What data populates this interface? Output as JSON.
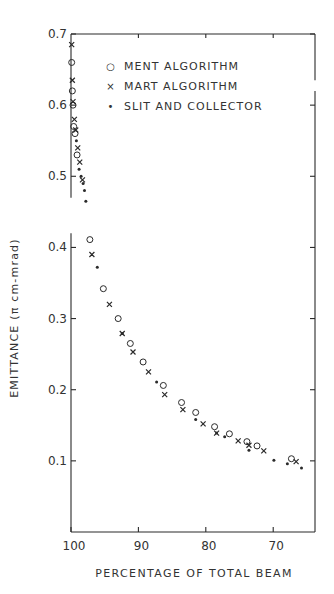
{
  "chart_data": {
    "type": "scatter",
    "title": "",
    "xlabel": "PERCENTAGE OF TOTAL BEAM",
    "ylabel": "EMITTANCE (π cm-mrad)",
    "xlim": [
      100,
      63.8
    ],
    "ylim": [
      0.0,
      0.7
    ],
    "x_inverted": true,
    "x_ticks": [
      100,
      90,
      80,
      70
    ],
    "x_tick_labels": [
      "100",
      "90",
      "80",
      "70"
    ],
    "y_ticks": [
      0.1,
      0.2,
      0.3,
      0.4,
      0.5,
      0.6,
      0.7
    ],
    "y_tick_labels": [
      "0.1",
      "0.2",
      "0.3",
      "0.4",
      "0.5",
      "0.6",
      "0.7"
    ],
    "y_axis_break": [
      0.42,
      0.47
    ],
    "grid": false,
    "legend_position": "upper center",
    "series": [
      {
        "name": "MENT ALGORITHM",
        "marker": "open-circle",
        "points": [
          [
            99.9,
            0.66
          ],
          [
            99.8,
            0.62
          ],
          [
            99.7,
            0.6
          ],
          [
            99.6,
            0.57
          ],
          [
            99.4,
            0.56
          ],
          [
            99.1,
            0.53
          ],
          [
            97.2,
            0.411
          ],
          [
            95.2,
            0.342
          ],
          [
            93.0,
            0.3
          ],
          [
            91.2,
            0.265
          ],
          [
            89.3,
            0.239
          ],
          [
            86.3,
            0.206
          ],
          [
            83.6,
            0.182
          ],
          [
            81.5,
            0.168
          ],
          [
            78.7,
            0.148
          ],
          [
            76.5,
            0.138
          ],
          [
            73.9,
            0.127
          ],
          [
            72.4,
            0.121
          ],
          [
            67.3,
            0.103
          ]
        ]
      },
      {
        "name": "MART ALGORITHM",
        "marker": "x",
        "points": [
          [
            99.9,
            0.685
          ],
          [
            99.8,
            0.635
          ],
          [
            99.7,
            0.605
          ],
          [
            99.5,
            0.58
          ],
          [
            99.3,
            0.565
          ],
          [
            99.0,
            0.54
          ],
          [
            98.7,
            0.52
          ],
          [
            98.3,
            0.495
          ],
          [
            96.9,
            0.39
          ],
          [
            94.3,
            0.32
          ],
          [
            92.4,
            0.279
          ],
          [
            90.8,
            0.253
          ],
          [
            88.5,
            0.225
          ],
          [
            86.1,
            0.193
          ],
          [
            83.4,
            0.172
          ],
          [
            80.4,
            0.152
          ],
          [
            78.4,
            0.139
          ],
          [
            75.2,
            0.128
          ],
          [
            73.6,
            0.122
          ],
          [
            71.4,
            0.114
          ],
          [
            66.6,
            0.099
          ]
        ]
      },
      {
        "name": "SLIT AND COLLECTOR",
        "marker": "dot",
        "points": [
          [
            99.2,
            0.55
          ],
          [
            98.8,
            0.51
          ],
          [
            98.5,
            0.5
          ],
          [
            98.2,
            0.49
          ],
          [
            98.0,
            0.48
          ],
          [
            97.8,
            0.465
          ],
          [
            96.1,
            0.372
          ],
          [
            92.4,
            0.279
          ],
          [
            87.3,
            0.211
          ],
          [
            81.5,
            0.158
          ],
          [
            78.4,
            0.139
          ],
          [
            77.2,
            0.134
          ],
          [
            73.6,
            0.115
          ],
          [
            69.9,
            0.101
          ],
          [
            67.9,
            0.096
          ],
          [
            65.8,
            0.09
          ]
        ]
      }
    ]
  },
  "legend": {
    "items": [
      {
        "symbol": "○",
        "label": "MENT ALGORITHM"
      },
      {
        "symbol": "×",
        "label": "MART ALGORITHM"
      },
      {
        "symbol": "•",
        "label": "SLIT AND COLLECTOR"
      }
    ]
  },
  "colors": {
    "ink": "#2a2a2a",
    "background": "#ffffff"
  }
}
